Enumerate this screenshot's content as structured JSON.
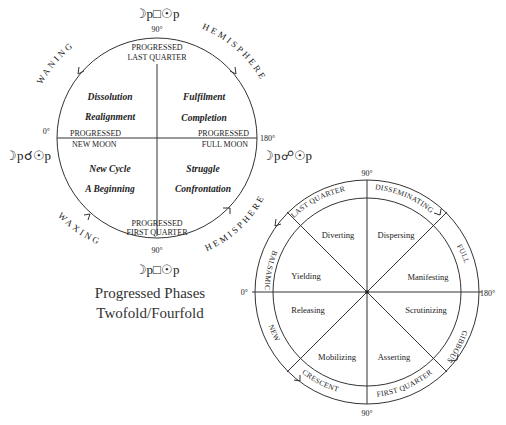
{
  "diagram_left": {
    "title_top": "☽p□☉p",
    "title_bottom": "☽p□☉p",
    "left_aspect": "☽p☌☉p",
    "right_aspect": "☽p☍☉p",
    "degrees": {
      "top": "90°",
      "bottom": "90°",
      "left": "0°",
      "right": "180°"
    },
    "arc_labels": {
      "waning": "WANING",
      "hemisphere_top": "HEMISPHERE",
      "waxing": "WAXING",
      "hemisphere_bottom": "HEMISPHERE"
    },
    "axis_labels": {
      "top_line1": "PROGRESSED",
      "top_line2": "LAST QUARTER",
      "bottom_line1": "PROGRESSED",
      "bottom_line2": "FIRST QUARTER",
      "left_line1": "PROGRESSED",
      "left_line2": "NEW MOON",
      "right_line1": "PROGRESSED",
      "right_line2": "FULL MOON"
    },
    "quadrants": {
      "top_left": [
        "Dissolution",
        "Realignment"
      ],
      "top_right": [
        "Fulfilment",
        "Completion"
      ],
      "bottom_left": [
        "New Cycle",
        "A Beginning"
      ],
      "bottom_right": [
        "Struggle",
        "Confrontation"
      ]
    },
    "caption": [
      "Progressed Phases",
      "Twofold/Fourfold"
    ]
  },
  "diagram_right": {
    "degrees": {
      "top": "90°",
      "bottom": "90°",
      "left": "0°",
      "right": "180°"
    },
    "ring_labels": {
      "last_quarter": "LAST QUARTER",
      "disseminating": "DISSEMINATING",
      "full": "FULL",
      "gibbous": "GIBBOUS",
      "first_quarter": "FIRST QUARTER",
      "crescent": "CRESCENT",
      "new": "NEW",
      "balsamic": "BALSAMIC"
    },
    "sectors": {
      "diverting": "Diverting",
      "dispersing": "Dispersing",
      "manifesting": "Manifesting",
      "scrutinizing": "Scrutinizing",
      "asserting": "Asserting",
      "mobilizing": "Mobilizing",
      "releasing": "Releasing",
      "yielding": "Yielding"
    }
  }
}
